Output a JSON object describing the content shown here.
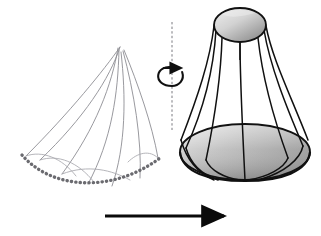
{
  "figure": {
    "title": "Surface of revolution generated by revolving a plane profile about a vertical axis",
    "background_color": "#ffffff",
    "width": 321,
    "height": 236
  },
  "colors": {
    "background": "#ffffff",
    "profile_curve": "#8d8d93",
    "profile_curve_light": "#a8a8ae",
    "dotted_baseline": "#6b6b70",
    "solid_outline": "#101010",
    "arrow": "#0a0a0a",
    "axis_dash": "#7a7a80",
    "surface_light": "#e2e2e2",
    "surface_mid": "#b4b4b4",
    "surface_dark": "#8a8a8a",
    "top_cap_light": "#dcdcdc",
    "top_cap_dark": "#8f8f8f"
  },
  "left_panel": {
    "name": "profile-curve-family",
    "description": "Family of thin grey curves fanning from a common apex down to a dotted baseline",
    "apex": {
      "x": 120,
      "y": 47
    },
    "baseline": {
      "name": "dotted-baseline",
      "style": "dotted",
      "dot_count": 58,
      "x_start": 22,
      "x_end": 160,
      "y_left": 155,
      "y_min": 185,
      "y_right": 158
    },
    "curves": [
      {
        "id": "c1",
        "d": "M120,47 C104,70 70,112 26,156"
      },
      {
        "id": "c2",
        "d": "M120,47 C110,78 84,118 40,160"
      },
      {
        "id": "c3",
        "d": "M118,48 C112,84 96,128 62,174"
      },
      {
        "id": "c4",
        "d": "M119,50 C118,92 112,140 88,184"
      },
      {
        "id": "c5",
        "d": "M121,52 C126,96 126,146 112,186"
      },
      {
        "id": "c6",
        "d": "M123,51 C134,92 142,140 140,178"
      },
      {
        "id": "c7",
        "d": "M124,50 C138,84 152,124 158,158"
      },
      {
        "id": "c8",
        "d": "M26,156 C42,150 62,158 76,176"
      },
      {
        "id": "c9",
        "d": "M40,160 C58,154 78,162 94,182"
      },
      {
        "id": "c10",
        "d": "M62,174 C88,164 112,170 130,180"
      },
      {
        "id": "c11",
        "d": "M158,158 C150,150 138,152 128,162"
      }
    ]
  },
  "center_panel": {
    "name": "revolution-axis",
    "axis_line": {
      "name": "dashed-axis-line",
      "x": 172,
      "y_top": 22,
      "y_bottom": 130,
      "style": "dashed"
    },
    "rotation_symbol": {
      "name": "rotation-arrow-icon",
      "center_x": 172,
      "center_y": 76,
      "rx": 13,
      "ry": 8,
      "direction": "counterclockwise",
      "meaning": "revolve about vertical axis"
    }
  },
  "right_panel": {
    "name": "surface-of-revolution",
    "description": "Bell or vase shaped surface of revolution with shaded top cap and shaded lower dome",
    "top_cap": {
      "name": "top-cap-ellipse",
      "cx": 240,
      "cy": 25,
      "rx": 26,
      "ry": 17
    },
    "bottom_dome": {
      "name": "bottom-dome-ellipse",
      "cx": 245,
      "cy": 152,
      "rx": 65,
      "ry": 28
    },
    "meridians": [
      {
        "id": "m1",
        "d": "M214,26 C210,60 198,96 181,140"
      },
      {
        "id": "m2",
        "d": "M216,30 C214,64 206,104 186,148"
      },
      {
        "id": "m3",
        "d": "M222,38 C221,72 216,112 206,160"
      },
      {
        "id": "m4",
        "d": "M240,42 C240,80 242,120 245,180"
      },
      {
        "id": "m5",
        "d": "M258,38 C262,74 272,114 288,158"
      },
      {
        "id": "m6",
        "d": "M264,30 C270,66 286,106 303,146"
      },
      {
        "id": "m7",
        "d": "M266,26 C272,58 290,94 308,140"
      }
    ],
    "dome_curves": [
      {
        "id": "d1",
        "d": "M181,140 C186,158 196,172 214,180"
      },
      {
        "id": "d2",
        "d": "M186,148 C190,162 200,174 218,180"
      },
      {
        "id": "d3",
        "d": "M206,160 C210,170 224,178 240,180"
      },
      {
        "id": "d4",
        "d": "M288,158 C284,168 268,177 248,180"
      },
      {
        "id": "d5",
        "d": "M303,146 C300,160 284,172 262,179"
      }
    ]
  },
  "bottom_arrow": {
    "name": "transformation-arrow",
    "x_start": 105,
    "x_end": 228,
    "y": 216,
    "direction": "right",
    "stroke_width": 3
  }
}
